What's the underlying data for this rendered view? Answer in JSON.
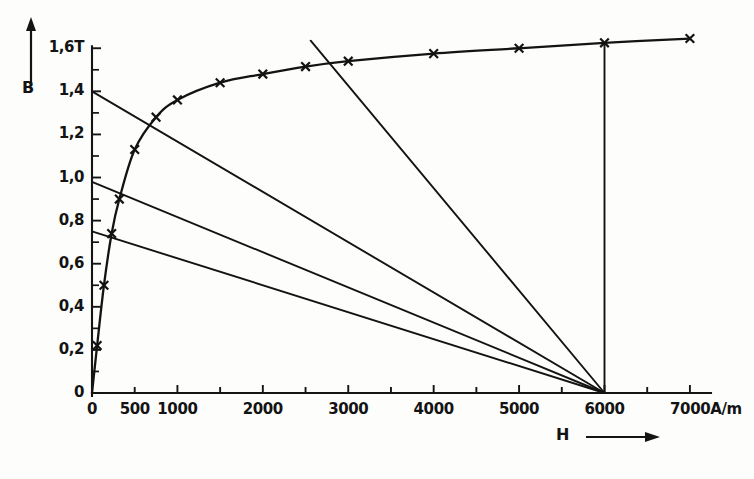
{
  "chart_data": {
    "type": "line",
    "title": "",
    "subtitle": "",
    "xlabel": "H",
    "ylabel": "B",
    "x_unit": "A/m",
    "y_unit": "T",
    "xlim": [
      0,
      7200
    ],
    "ylim": [
      0,
      1.68
    ],
    "grid": false,
    "legend": "none",
    "x_ticks_major": [
      0,
      500,
      1000,
      1500,
      2000,
      2500,
      3000,
      3500,
      4000,
      4500,
      5000,
      5500,
      6000,
      6500,
      7000
    ],
    "x_tick_labels": [
      {
        "value": 0,
        "text": "0"
      },
      {
        "value": 500,
        "text": "500"
      },
      {
        "value": 1000,
        "text": "1000"
      },
      {
        "value": 2000,
        "text": "2000"
      },
      {
        "value": 3000,
        "text": "3000"
      },
      {
        "value": 4000,
        "text": "4000"
      },
      {
        "value": 5000,
        "text": "5000"
      },
      {
        "value": 6000,
        "text": "6000"
      },
      {
        "value": 7000,
        "text": "7000A/m"
      }
    ],
    "y_ticks_major": [
      0,
      0.2,
      0.4,
      0.6,
      0.8,
      1.0,
      1.2,
      1.4,
      1.6
    ],
    "y_ticks_minor": [
      0.1,
      0.3,
      0.5,
      0.7,
      0.9,
      1.1,
      1.3,
      1.5
    ],
    "y_tick_labels": [
      {
        "value": 0,
        "text": "0"
      },
      {
        "value": 0.2,
        "text": "0,2"
      },
      {
        "value": 0.4,
        "text": "0,4"
      },
      {
        "value": 0.6,
        "text": "0,6"
      },
      {
        "value": 0.8,
        "text": "0,8"
      },
      {
        "value": 1.0,
        "text": "1,0"
      },
      {
        "value": 1.2,
        "text": "1,2"
      },
      {
        "value": 1.4,
        "text": "1,4"
      },
      {
        "value": 1.6,
        "text": "1,6T"
      }
    ],
    "series": [
      {
        "name": "magnetization-curve",
        "marker": "x",
        "points": [
          {
            "x": 0,
            "y": 0.0
          },
          {
            "x": 60,
            "y": 0.22
          },
          {
            "x": 140,
            "y": 0.5
          },
          {
            "x": 230,
            "y": 0.74
          },
          {
            "x": 320,
            "y": 0.9
          },
          {
            "x": 500,
            "y": 1.13
          },
          {
            "x": 750,
            "y": 1.28
          },
          {
            "x": 1000,
            "y": 1.36
          },
          {
            "x": 1500,
            "y": 1.44
          },
          {
            "x": 2000,
            "y": 1.48
          },
          {
            "x": 2500,
            "y": 1.515
          },
          {
            "x": 3000,
            "y": 1.54
          },
          {
            "x": 4000,
            "y": 1.575
          },
          {
            "x": 5000,
            "y": 1.6
          },
          {
            "x": 6000,
            "y": 1.625
          },
          {
            "x": 7000,
            "y": 1.645
          }
        ]
      },
      {
        "name": "load-line-1",
        "marker": "none",
        "points": [
          {
            "x": 0,
            "y": 1.4
          },
          {
            "x": 6000,
            "y": 0.0
          }
        ]
      },
      {
        "name": "load-line-2",
        "marker": "none",
        "points": [
          {
            "x": 0,
            "y": 0.98
          },
          {
            "x": 6000,
            "y": 0.0
          }
        ]
      },
      {
        "name": "load-line-3",
        "marker": "none",
        "points": [
          {
            "x": 0,
            "y": 0.75
          },
          {
            "x": 6000,
            "y": 0.0
          }
        ]
      },
      {
        "name": "load-line-4",
        "marker": "none",
        "points": [
          {
            "x": 2560,
            "y": 1.635
          },
          {
            "x": 6000,
            "y": 0.0
          }
        ]
      },
      {
        "name": "operating-point-drop-line",
        "marker": "none",
        "points": [
          {
            "x": 6000,
            "y": 1.625
          },
          {
            "x": 6000,
            "y": 0.0
          }
        ]
      }
    ],
    "annotations": [
      {
        "name": "y-axis-arrow",
        "text": ""
      },
      {
        "name": "x-axis-arrow",
        "text": ""
      }
    ]
  },
  "labels": {
    "y_axis_name": "B",
    "x_axis_name": "H"
  }
}
